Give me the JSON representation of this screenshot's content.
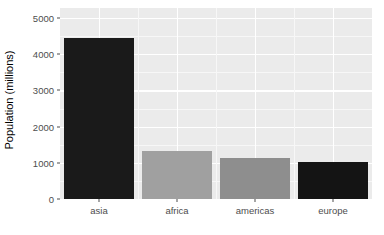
{
  "chart_data": {
    "type": "bar",
    "title": "",
    "subtitle": "",
    "xlabel": "",
    "ylabel": "Population (millions)",
    "categories": [
      "asia",
      "africa",
      "americas",
      "europe"
    ],
    "values": [
      4450,
      1330,
      1130,
      1010
    ],
    "bar_colors": [
      "#1a1a1a",
      "#a0a0a0",
      "#8e8e8e",
      "#141414"
    ],
    "ylim": [
      0,
      5280
    ],
    "y_ticks": [
      0,
      1000,
      2000,
      3000,
      4000,
      5000
    ],
    "y_tick_labels": [
      "0",
      "1000",
      "2000",
      "3000",
      "4000",
      "5000"
    ],
    "y_minor_ticks": [
      500,
      1500,
      2500,
      3500,
      4500
    ],
    "grid": true,
    "legend": "none",
    "theme": {
      "panel_background": "#ebebeb",
      "grid_major_color": "#ffffff",
      "grid_minor_color": "#f7f7f7",
      "plot_background": "#ffffff",
      "axis_text_color": "#4d4d4d",
      "axis_title_color": "#000000"
    }
  }
}
